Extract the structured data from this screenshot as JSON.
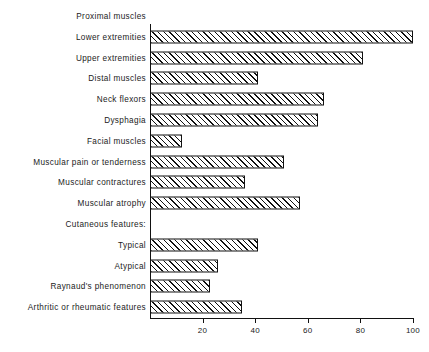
{
  "chart_data": {
    "type": "bar",
    "orientation": "horizontal",
    "title": "",
    "xlabel": "",
    "ylabel": "",
    "xlim": [
      0,
      100
    ],
    "grid": false,
    "legend": null,
    "xticks": [
      20,
      40,
      60,
      80,
      100
    ],
    "xtick_labels": [
      "20",
      "40",
      "60",
      "80",
      "100"
    ],
    "categories": [
      "Proximal muscles",
      "Lower extremities",
      "Upper extremities",
      "Distal muscles",
      "Neck flexors",
      "Dysphagia",
      "Facial muscles",
      "Muscular pain or tenderness",
      "Muscular contractures",
      "Muscular atrophy",
      "Cutaneous features:",
      "Typical",
      "Atypical",
      "Raynaud's phenomenon",
      "Arthritic or rheumatic features"
    ],
    "values": [
      null,
      100,
      81,
      41,
      66,
      64,
      12,
      51,
      36,
      57,
      null,
      41,
      26,
      23,
      35
    ],
    "rows": [
      {
        "label": "Proximal muscles",
        "value": null,
        "header": true,
        "indent": 0
      },
      {
        "label": "Lower extremities",
        "value": 100,
        "header": false,
        "indent": 1
      },
      {
        "label": "Upper extremities",
        "value": 81,
        "header": false,
        "indent": 1
      },
      {
        "label": "Distal muscles",
        "value": 41,
        "header": false,
        "indent": 0
      },
      {
        "label": "Neck flexors",
        "value": 66,
        "header": false,
        "indent": 0
      },
      {
        "label": "Dysphagia",
        "value": 64,
        "header": false,
        "indent": 0
      },
      {
        "label": "Facial muscles",
        "value": 12,
        "header": false,
        "indent": 0
      },
      {
        "label": "Muscular pain or tenderness",
        "value": 51,
        "header": false,
        "indent": 0
      },
      {
        "label": "Muscular contractures",
        "value": 36,
        "header": false,
        "indent": 0
      },
      {
        "label": "Muscular atrophy",
        "value": 57,
        "header": false,
        "indent": 0
      },
      {
        "label": "Cutaneous features:",
        "value": null,
        "header": true,
        "indent": 0
      },
      {
        "label": "Typical",
        "value": 41,
        "header": false,
        "indent": 1
      },
      {
        "label": "Atypical",
        "value": 26,
        "header": false,
        "indent": 1
      },
      {
        "label": "Raynaud's phenomenon",
        "value": 23,
        "header": false,
        "indent": 0
      },
      {
        "label": "Arthritic or rheumatic features",
        "value": 35,
        "header": false,
        "indent": 0
      }
    ],
    "colors": {
      "bar_fill": "#ffffff",
      "bar_hatch": "#111111",
      "bar_edge": "#111111",
      "axis": "#111111",
      "text": "#1b1b1b",
      "background": "#ffffff"
    }
  }
}
